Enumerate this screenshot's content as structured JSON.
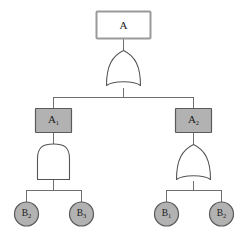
{
  "diagram": {
    "type": "fault-tree",
    "title": "",
    "background_color": "#ffffff",
    "line_color": "#6e6e6e",
    "text_color": "#1a1a1a",
    "nodes": {
      "top_event": {
        "label": "A",
        "base": "A",
        "subscript": "",
        "shape": "rectangle",
        "fill": "#ffffff",
        "stroke": "#9a9a9a"
      },
      "intermediate_left": {
        "label": "A1",
        "base": "A",
        "subscript": "1",
        "shape": "rectangle",
        "fill": "#b2b2b2",
        "stroke": "#5a5a5a"
      },
      "intermediate_right": {
        "label": "A2",
        "base": "A",
        "subscript": "2",
        "shape": "rectangle",
        "fill": "#b2b2b2",
        "stroke": "#5a5a5a"
      },
      "basic_event_1": {
        "label": "B2",
        "base": "B",
        "subscript": "2",
        "shape": "circle",
        "fill": "#b2b2b2",
        "stroke": "#5a5a5a"
      },
      "basic_event_2": {
        "label": "B3",
        "base": "B",
        "subscript": "3",
        "shape": "circle",
        "fill": "#b2b2b2",
        "stroke": "#5a5a5a"
      },
      "basic_event_3": {
        "label": "B1",
        "base": "B",
        "subscript": "1",
        "shape": "circle",
        "fill": "#b2b2b2",
        "stroke": "#5a5a5a"
      },
      "basic_event_4": {
        "label": "B2",
        "base": "B",
        "subscript": "2",
        "shape": "circle",
        "fill": "#b2b2b2",
        "stroke": "#5a5a5a"
      }
    },
    "gates": {
      "gate_top": {
        "type": "OR",
        "name": "or-gate",
        "fill": "#ffffff",
        "stroke": "#555555"
      },
      "gate_left": {
        "type": "AND",
        "name": "and-gate",
        "fill": "#ffffff",
        "stroke": "#555555"
      },
      "gate_right": {
        "type": "OR",
        "name": "or-gate",
        "fill": "#ffffff",
        "stroke": "#555555"
      }
    }
  }
}
